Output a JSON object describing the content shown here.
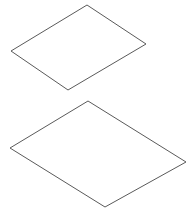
{
  "canvas": {
    "width": 189,
    "height": 208,
    "background_color": "#ffffff"
  },
  "figure": {
    "shape_count": 2,
    "stroke_color": "#5a5a5a",
    "fill_color": "#ffffff",
    "stroke_width": 1
  },
  "shapes": [
    {
      "name": "upper-quadrilateral",
      "label": "Upper plane",
      "points": "87,5 146,44 68,90 11,51",
      "vertices": [
        {
          "label": "top",
          "x": 87,
          "y": 5
        },
        {
          "label": "right",
          "x": 146,
          "y": 44
        },
        {
          "label": "bottom",
          "x": 68,
          "y": 90
        },
        {
          "label": "left",
          "x": 11,
          "y": 51
        }
      ]
    },
    {
      "name": "lower-quadrilateral",
      "label": "Lower plane",
      "points": "88,101 186,162 105,207 10,148",
      "vertices": [
        {
          "label": "top",
          "x": 88,
          "y": 101
        },
        {
          "label": "right",
          "x": 186,
          "y": 162
        },
        {
          "label": "bottom",
          "x": 105,
          "y": 207
        },
        {
          "label": "left",
          "x": 10,
          "y": 148
        }
      ]
    }
  ]
}
